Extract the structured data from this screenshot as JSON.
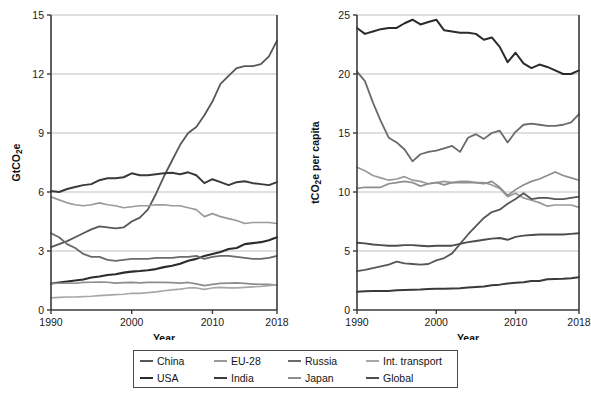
{
  "chart_data": [
    {
      "id": "left",
      "type": "line",
      "title": "",
      "xlabel": "Year",
      "ylabel": "GtCO2e",
      "ylabel_display": "GtCO₂e",
      "xlim": [
        1990,
        2018
      ],
      "ylim": [
        0,
        15
      ],
      "yticks": [
        0,
        3,
        6,
        9,
        12,
        15
      ],
      "xticks": [
        1990,
        2000,
        2010,
        2018
      ],
      "grid": "horizontal",
      "x": [
        1990,
        1991,
        1992,
        1993,
        1994,
        1995,
        1996,
        1997,
        1998,
        1999,
        2000,
        2001,
        2002,
        2003,
        2004,
        2005,
        2006,
        2007,
        2008,
        2009,
        2010,
        2011,
        2012,
        2013,
        2014,
        2015,
        2016,
        2017,
        2018
      ],
      "series": [
        {
          "name": "China",
          "color": "#575757",
          "width": 1.8,
          "values": [
            3.2,
            3.35,
            3.5,
            3.7,
            3.9,
            4.1,
            4.25,
            4.2,
            4.15,
            4.2,
            4.5,
            4.7,
            5.1,
            5.9,
            6.8,
            7.6,
            8.4,
            9.0,
            9.3,
            9.9,
            10.6,
            11.5,
            11.9,
            12.3,
            12.4,
            12.4,
            12.5,
            12.9,
            13.7
          ]
        },
        {
          "name": "USA",
          "color": "#3a3a3a",
          "width": 2.0,
          "values": [
            6.05,
            6.0,
            6.15,
            6.25,
            6.35,
            6.4,
            6.6,
            6.7,
            6.7,
            6.75,
            6.95,
            6.85,
            6.85,
            6.9,
            6.95,
            6.98,
            6.9,
            7.0,
            6.85,
            6.45,
            6.65,
            6.5,
            6.35,
            6.5,
            6.55,
            6.45,
            6.4,
            6.35,
            6.5
          ]
        },
        {
          "name": "EU-28",
          "color": "#9a9a9a",
          "width": 1.7,
          "values": [
            5.75,
            5.6,
            5.45,
            5.35,
            5.3,
            5.35,
            5.45,
            5.35,
            5.3,
            5.2,
            5.25,
            5.3,
            5.3,
            5.35,
            5.35,
            5.3,
            5.3,
            5.2,
            5.1,
            4.75,
            4.9,
            4.75,
            4.65,
            4.55,
            4.4,
            4.45,
            4.45,
            4.45,
            4.4
          ]
        },
        {
          "name": "India",
          "color": "#2b2b2b",
          "width": 2.1,
          "values": [
            1.35,
            1.4,
            1.45,
            1.5,
            1.55,
            1.65,
            1.7,
            1.78,
            1.82,
            1.9,
            1.95,
            1.98,
            2.02,
            2.08,
            2.18,
            2.25,
            2.35,
            2.5,
            2.6,
            2.75,
            2.85,
            2.95,
            3.1,
            3.15,
            3.35,
            3.4,
            3.45,
            3.55,
            3.7
          ]
        },
        {
          "name": "Russia",
          "color": "#6a6a6a",
          "width": 1.8,
          "values": [
            3.9,
            3.7,
            3.35,
            3.15,
            2.85,
            2.7,
            2.7,
            2.55,
            2.5,
            2.55,
            2.6,
            2.6,
            2.6,
            2.65,
            2.65,
            2.65,
            2.7,
            2.7,
            2.75,
            2.6,
            2.7,
            2.75,
            2.75,
            2.7,
            2.65,
            2.6,
            2.6,
            2.65,
            2.75
          ]
        },
        {
          "name": "Japan",
          "color": "#8d8d8d",
          "width": 1.7,
          "values": [
            1.35,
            1.36,
            1.37,
            1.36,
            1.4,
            1.41,
            1.42,
            1.41,
            1.37,
            1.39,
            1.4,
            1.38,
            1.4,
            1.41,
            1.4,
            1.39,
            1.37,
            1.4,
            1.33,
            1.24,
            1.3,
            1.35,
            1.37,
            1.38,
            1.35,
            1.32,
            1.31,
            1.3,
            1.27
          ]
        },
        {
          "name": "Int. transport",
          "color": "#a8a8a8",
          "width": 1.7,
          "values": [
            0.62,
            0.64,
            0.66,
            0.66,
            0.68,
            0.7,
            0.73,
            0.76,
            0.78,
            0.8,
            0.85,
            0.85,
            0.88,
            0.92,
            0.98,
            1.02,
            1.06,
            1.12,
            1.12,
            1.05,
            1.12,
            1.15,
            1.12,
            1.12,
            1.15,
            1.18,
            1.2,
            1.24,
            1.28
          ]
        },
        {
          "name": "Global",
          "color": "#7d7d7d",
          "width": 1.8,
          "values": [
            null,
            null,
            null,
            null,
            null,
            null,
            null,
            null,
            null,
            null,
            null,
            null,
            null,
            null,
            null,
            null,
            null,
            null,
            null,
            null,
            null,
            null,
            null,
            null,
            null,
            null,
            null,
            null,
            null
          ]
        }
      ]
    },
    {
      "id": "right",
      "type": "line",
      "title": "",
      "xlabel": "Year",
      "ylabel": "tCO2e per capita",
      "ylabel_display": "tCO₂e per capita",
      "xlim": [
        1990,
        2018
      ],
      "ylim": [
        0,
        25
      ],
      "yticks": [
        0,
        5,
        10,
        15,
        20,
        25
      ],
      "xticks": [
        1990,
        2000,
        2010,
        2018
      ],
      "grid": "horizontal",
      "x": [
        1990,
        1991,
        1992,
        1993,
        1994,
        1995,
        1996,
        1997,
        1998,
        1999,
        2000,
        2001,
        2002,
        2003,
        2004,
        2005,
        2006,
        2007,
        2008,
        2009,
        2010,
        2011,
        2012,
        2013,
        2014,
        2015,
        2016,
        2017,
        2018
      ],
      "series": [
        {
          "name": "USA",
          "color": "#2b2b2b",
          "width": 2.0,
          "values": [
            23.9,
            23.4,
            23.6,
            23.8,
            23.9,
            23.9,
            24.3,
            24.6,
            24.2,
            24.4,
            24.6,
            23.7,
            23.6,
            23.5,
            23.5,
            23.4,
            22.9,
            23.1,
            22.3,
            21.0,
            21.8,
            20.9,
            20.5,
            20.8,
            20.6,
            20.3,
            20.0,
            20.0,
            20.3
          ]
        },
        {
          "name": "Russia",
          "color": "#6a6a6a",
          "width": 1.8,
          "values": [
            20.2,
            19.4,
            17.6,
            16.0,
            14.6,
            14.2,
            13.6,
            12.6,
            13.2,
            13.4,
            13.5,
            13.7,
            13.9,
            13.4,
            14.6,
            14.9,
            14.5,
            15.0,
            15.2,
            14.2,
            15.1,
            15.7,
            15.8,
            15.7,
            15.6,
            15.6,
            15.7,
            15.9,
            16.6
          ]
        },
        {
          "name": "EU-28",
          "color": "#9a9a9a",
          "width": 1.7,
          "values": [
            12.1,
            11.8,
            11.4,
            11.2,
            11.0,
            11.1,
            11.3,
            11.0,
            10.9,
            10.7,
            10.8,
            10.9,
            10.8,
            10.9,
            10.9,
            10.8,
            10.8,
            10.6,
            10.3,
            9.6,
            9.9,
            9.5,
            9.3,
            9.1,
            8.8,
            8.9,
            8.9,
            8.9,
            8.7
          ]
        },
        {
          "name": "Japan",
          "color": "#8d8d8d",
          "width": 1.7,
          "values": [
            10.3,
            10.4,
            10.4,
            10.4,
            10.7,
            10.8,
            10.9,
            10.8,
            10.5,
            10.7,
            10.8,
            10.6,
            10.8,
            10.8,
            10.8,
            10.8,
            10.7,
            10.9,
            10.4,
            9.7,
            10.2,
            10.6,
            10.9,
            11.1,
            11.4,
            11.7,
            11.4,
            11.2,
            11.0
          ]
        },
        {
          "name": "China",
          "color": "#575757",
          "width": 1.8,
          "values": [
            3.3,
            3.4,
            3.55,
            3.7,
            3.85,
            4.1,
            3.95,
            3.9,
            3.85,
            3.9,
            4.2,
            4.4,
            4.8,
            5.6,
            6.4,
            7.1,
            7.8,
            8.3,
            8.5,
            9.0,
            9.4,
            9.9,
            9.4,
            9.5,
            9.5,
            9.4,
            9.4,
            9.5,
            9.6
          ]
        },
        {
          "name": "Global",
          "color": "#4d4d4d",
          "width": 1.9,
          "values": [
            5.7,
            5.65,
            5.55,
            5.5,
            5.45,
            5.45,
            5.5,
            5.5,
            5.45,
            5.4,
            5.45,
            5.45,
            5.45,
            5.6,
            5.75,
            5.85,
            5.95,
            6.05,
            6.1,
            5.95,
            6.2,
            6.3,
            6.35,
            6.4,
            6.4,
            6.4,
            6.4,
            6.45,
            6.5
          ]
        },
        {
          "name": "India",
          "color": "#3a3a3a",
          "width": 2.0,
          "values": [
            1.55,
            1.58,
            1.6,
            1.6,
            1.62,
            1.68,
            1.7,
            1.72,
            1.73,
            1.78,
            1.8,
            1.8,
            1.82,
            1.85,
            1.9,
            1.95,
            2.0,
            2.1,
            2.15,
            2.25,
            2.3,
            2.35,
            2.45,
            2.45,
            2.6,
            2.62,
            2.65,
            2.7,
            2.78
          ]
        },
        {
          "name": "Int. transport",
          "color": "#a8a8a8",
          "width": 1.7,
          "values": [
            null,
            null,
            null,
            null,
            null,
            null,
            null,
            null,
            null,
            null,
            null,
            null,
            null,
            null,
            null,
            null,
            null,
            null,
            null,
            null,
            null,
            null,
            null,
            null,
            null,
            null,
            null,
            null,
            null
          ]
        }
      ]
    }
  ],
  "legend": {
    "items": [
      {
        "label": "China",
        "color": "#575757"
      },
      {
        "label": "EU-28",
        "color": "#9a9a9a"
      },
      {
        "label": "Russia",
        "color": "#6a6a6a"
      },
      {
        "label": "Int. transport",
        "color": "#a8a8a8"
      },
      {
        "label": "USA",
        "color": "#2b2b2b"
      },
      {
        "label": "India",
        "color": "#3a3a3a"
      },
      {
        "label": "Japan",
        "color": "#8d8d8d"
      },
      {
        "label": "Global",
        "color": "#4d4d4d"
      }
    ]
  }
}
